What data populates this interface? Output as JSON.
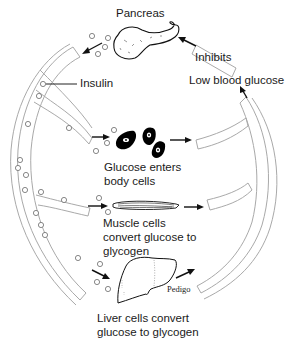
{
  "diagram": {
    "type": "cycle",
    "labels": {
      "pancreas": "Pancreas",
      "inhibits": "Inhibits",
      "insulin": "Insulin",
      "low_blood_glucose": "Low blood glucose",
      "body_cells_line1": "Glucose enters",
      "body_cells_line2": "body cells",
      "muscle_line1": "Muscle cells",
      "muscle_line2": "convert glucose to",
      "muscle_line3": "glycogen",
      "liver_line1": "Liver cells convert",
      "liver_line2": "glucose to glycogen",
      "signature": "Pedigo"
    },
    "nodes": [
      {
        "id": "pancreas",
        "label": "Pancreas"
      },
      {
        "id": "body_cells",
        "label": "Glucose enters body cells"
      },
      {
        "id": "muscle_cells",
        "label": "Muscle cells convert glucose to glycogen"
      },
      {
        "id": "liver_cells",
        "label": "Liver cells convert glucose to glycogen"
      },
      {
        "id": "low_glucose",
        "label": "Low blood glucose"
      }
    ],
    "edges": [
      {
        "from": "pancreas",
        "to": "blood_vessel",
        "label": "Insulin"
      },
      {
        "from": "blood_vessel",
        "to": "body_cells"
      },
      {
        "from": "blood_vessel",
        "to": "muscle_cells"
      },
      {
        "from": "blood_vessel",
        "to": "liver_cells"
      },
      {
        "from": "body_cells",
        "to": "low_glucose"
      },
      {
        "from": "muscle_cells",
        "to": "low_glucose"
      },
      {
        "from": "liver_cells",
        "to": "low_glucose"
      },
      {
        "from": "low_glucose",
        "to": "pancreas",
        "label": "Inhibits"
      }
    ],
    "colors": {
      "tube_stroke": "#a9a9a9",
      "text": "#1a1a1a",
      "cell_fill": "#000000"
    }
  }
}
